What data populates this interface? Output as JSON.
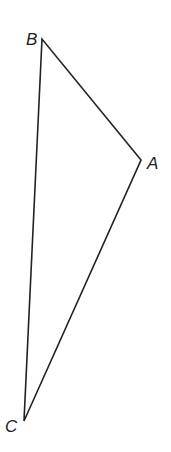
{
  "diagram": {
    "type": "triangle",
    "stroke_color": "#222222",
    "vertices": [
      {
        "label": "A",
        "x": 141,
        "y": 160
      },
      {
        "label": "B",
        "x": 42,
        "y": 39
      },
      {
        "label": "C",
        "x": 24,
        "y": 421
      }
    ],
    "edges": [
      [
        "A",
        "B"
      ],
      [
        "B",
        "C"
      ],
      [
        "C",
        "A"
      ]
    ]
  }
}
